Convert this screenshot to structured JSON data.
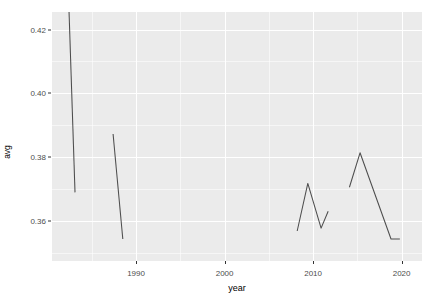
{
  "chart_data": {
    "type": "line",
    "title": "",
    "subtitle": "",
    "xlabel": "year",
    "ylabel": "avg",
    "xlim": [
      1980.5,
      2022.3
    ],
    "ylim": [
      0.3475,
      0.4255
    ],
    "grid": true,
    "legend": null,
    "x_ticks": [
      1990,
      2000,
      2010,
      2020
    ],
    "x_tick_labels": [
      "1990",
      "2000",
      "2010",
      "2020"
    ],
    "x_minor_ticks": [
      1985,
      1995,
      2005,
      2015
    ],
    "y_ticks": [
      0.36,
      0.38,
      0.4,
      0.42
    ],
    "y_tick_labels": [
      "0.36",
      "0.38",
      "0.40",
      "0.42"
    ],
    "y_minor_ticks": [
      0.35,
      0.37,
      0.39,
      0.41
    ],
    "panel_background": "#ebebeb",
    "grid_color": "#ffffff",
    "line_color": "#4d4d4d",
    "series": [
      {
        "name": "segment-1",
        "x": [
          1982.4,
          1983.1
        ],
        "values": [
          0.4277,
          0.369
        ]
      },
      {
        "name": "segment-2",
        "x": [
          1987.4,
          1988.5
        ],
        "values": [
          0.3873,
          0.3544
        ]
      },
      {
        "name": "segment-3",
        "x": [
          2008.2,
          2009.4,
          2010.9,
          2011.7
        ],
        "values": [
          0.3569,
          0.3718,
          0.3578,
          0.3631
        ]
      },
      {
        "name": "segment-4",
        "x": [
          2014.1,
          2015.3,
          2018.8,
          2019.8
        ],
        "values": [
          0.3706,
          0.3814,
          0.3544,
          0.3544
        ]
      }
    ]
  }
}
